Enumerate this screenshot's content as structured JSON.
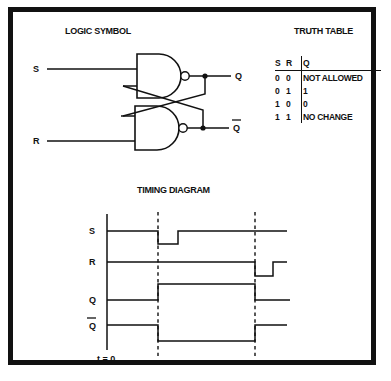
{
  "figure": {
    "border_color": "#111111",
    "background": "#ffffff",
    "ink_color": "#111111"
  },
  "logic_symbol": {
    "title": "LOGIC SYMBOL",
    "inputs": [
      {
        "label": "S",
        "feeds": "top-nand"
      },
      {
        "label": "R",
        "feeds": "bottom-nand"
      }
    ],
    "outputs": [
      {
        "label": "Q",
        "from": "top-nand"
      },
      {
        "label": "Q",
        "overbar": true,
        "from": "bottom-nand"
      }
    ],
    "gates": [
      {
        "name": "top-nand",
        "type": "NAND",
        "inverting_bubble": true
      },
      {
        "name": "bottom-nand",
        "type": "NAND",
        "inverting_bubble": true
      }
    ],
    "cross_coupled": true
  },
  "truth_table": {
    "title": "TRUTH TABLE",
    "headers": [
      "S",
      "R",
      "Q"
    ],
    "rows": [
      {
        "s": "0",
        "r": "0",
        "q": "NOT ALLOWED"
      },
      {
        "s": "0",
        "r": "1",
        "q": "1"
      },
      {
        "s": "1",
        "r": "0",
        "q": "0"
      },
      {
        "s": "1",
        "r": "1",
        "q": "NO CHANGE"
      }
    ]
  },
  "timing_diagram": {
    "title": "TIMING DIAGRAM",
    "origin_label": "t = 0",
    "signals": [
      {
        "label": "S",
        "overbar": false
      },
      {
        "label": "R",
        "overbar": false
      },
      {
        "label": "Q",
        "overbar": false
      },
      {
        "label": "Q",
        "overbar": true
      }
    ],
    "markers": [
      {
        "name": "set-edge",
        "x": 145
      },
      {
        "name": "reset-edge",
        "x": 242
      }
    ],
    "waveforms": {
      "S": "high, brief low pulse at first marker, then high",
      "R": "high until second marker, brief low pulse, then high",
      "Q": "low until first marker, high until second marker, then low",
      "Qbar": "high until first marker, low until second marker, then high"
    }
  }
}
